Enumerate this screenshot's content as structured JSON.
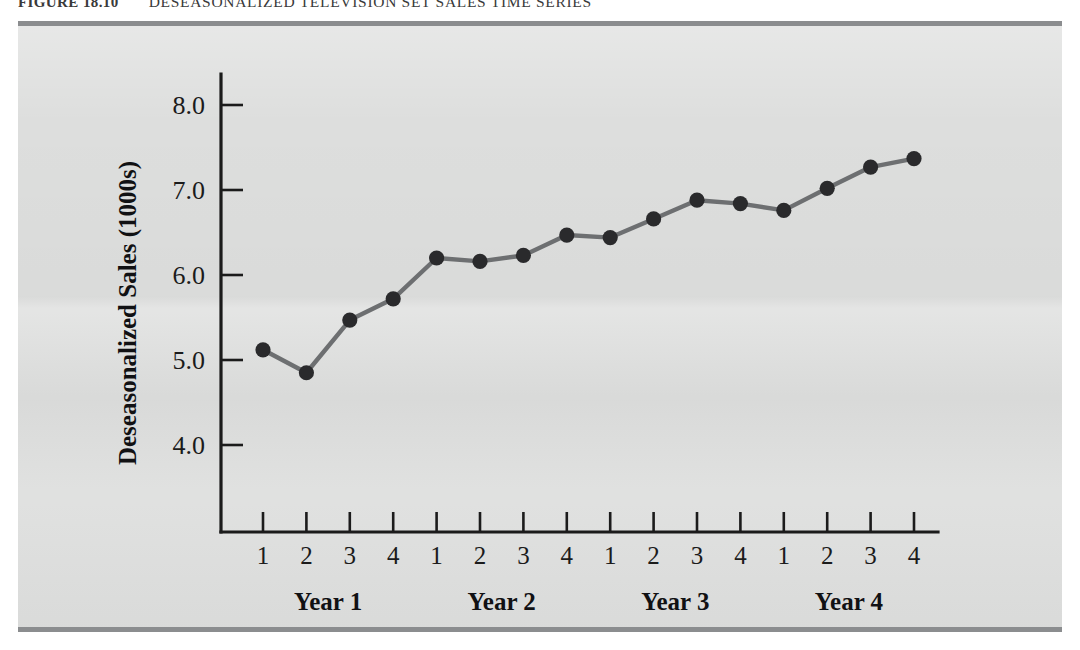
{
  "figure": {
    "label": "FIGURE 18.10",
    "title": "DESEASONALIZED TELEVISION SET SALES TIME SERIES"
  },
  "colors": {
    "panel_background": "#dddedd",
    "rule": "#8b8d8f",
    "axis": "#1b1b1b",
    "series_line": "#6d6f71",
    "series_marker": "#2a2a2c",
    "page_background": "#ffffff"
  },
  "chart_data": {
    "type": "line",
    "title": "DESEASONALIZED TELEVISION SET SALES TIME SERIES",
    "xlabel": "",
    "ylabel": "Deseasonalized Sales (1000s)",
    "xlim": [
      0.4,
      16.6
    ],
    "ylim": [
      3.3,
      8.6
    ],
    "yticks": [
      4.0,
      5.0,
      6.0,
      7.0,
      8.0
    ],
    "ytick_labels": [
      "4.0",
      "5.0",
      "6.0",
      "7.0",
      "8.0"
    ],
    "xtick_labels": [
      "1",
      "2",
      "3",
      "4",
      "1",
      "2",
      "3",
      "4",
      "1",
      "2",
      "3",
      "4",
      "1",
      "2",
      "3",
      "4"
    ],
    "group_labels": [
      "Year 1",
      "Year 2",
      "Year 3",
      "Year 4"
    ],
    "grid": false,
    "legend": false,
    "markers": "filled-circle",
    "x": [
      1,
      2,
      3,
      4,
      5,
      6,
      7,
      8,
      9,
      10,
      11,
      12,
      13,
      14,
      15,
      16
    ],
    "values": [
      5.12,
      4.85,
      5.47,
      5.72,
      6.2,
      6.16,
      6.23,
      6.47,
      6.44,
      6.66,
      6.88,
      6.84,
      6.76,
      7.02,
      7.27,
      7.37
    ],
    "points": [
      {
        "quarter": "1",
        "year": "Year 1",
        "value": 5.12
      },
      {
        "quarter": "2",
        "year": "Year 1",
        "value": 4.85
      },
      {
        "quarter": "3",
        "year": "Year 1",
        "value": 5.47
      },
      {
        "quarter": "4",
        "year": "Year 1",
        "value": 5.72
      },
      {
        "quarter": "1",
        "year": "Year 2",
        "value": 6.2
      },
      {
        "quarter": "2",
        "year": "Year 2",
        "value": 6.16
      },
      {
        "quarter": "3",
        "year": "Year 2",
        "value": 6.23
      },
      {
        "quarter": "4",
        "year": "Year 2",
        "value": 6.47
      },
      {
        "quarter": "1",
        "year": "Year 3",
        "value": 6.44
      },
      {
        "quarter": "2",
        "year": "Year 3",
        "value": 6.66
      },
      {
        "quarter": "3",
        "year": "Year 3",
        "value": 6.88
      },
      {
        "quarter": "4",
        "year": "Year 3",
        "value": 6.84
      },
      {
        "quarter": "1",
        "year": "Year 4",
        "value": 6.76
      },
      {
        "quarter": "2",
        "year": "Year 4",
        "value": 7.02
      },
      {
        "quarter": "3",
        "year": "Year 4",
        "value": 7.27
      },
      {
        "quarter": "4",
        "year": "Year 4",
        "value": 7.37
      }
    ]
  }
}
